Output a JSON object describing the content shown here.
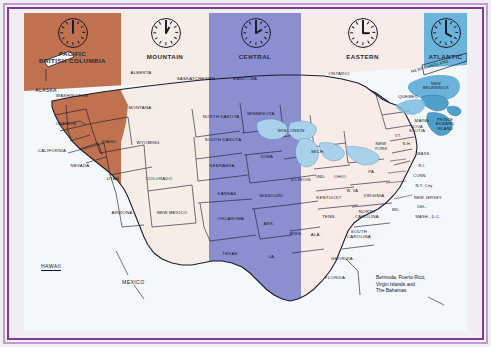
{
  "map": {
    "title": "North America Time Zone Map",
    "frame_color": "#7a3f8c",
    "background": "#f4f8fb",
    "zones": [
      {
        "id": "pacific",
        "label": "PACIFIC\nBRITISH COLUMBIA",
        "label_line1": "PACIFIC",
        "label_line2": "BRITISH COLUMBIA",
        "color": "#c0714f",
        "clock_hour": 12,
        "clock_minute": 0,
        "time": "12:00"
      },
      {
        "id": "mountain",
        "label": "MOUNTAIN",
        "label_line1": "MOUNTAIN",
        "label_line2": "",
        "color": "#f6eee6",
        "clock_hour": 1,
        "clock_minute": 0,
        "time": "1:00"
      },
      {
        "id": "central",
        "label": "CENTRAL",
        "label_line1": "CENTRAL",
        "label_line2": "",
        "color": "#8b8fd0",
        "clock_hour": 2,
        "clock_minute": 0,
        "time": "2:00"
      },
      {
        "id": "eastern",
        "label": "EASTERN",
        "label_line1": "EASTERN",
        "label_line2": "",
        "color": "#f9ece8",
        "clock_hour": 3,
        "clock_minute": 0,
        "time": "3:00"
      },
      {
        "id": "atlantic",
        "label": "ATLANTIC",
        "label_line1": "ATLANTIC",
        "label_line2": "",
        "color": "#6bb3da",
        "clock_hour": 4,
        "clock_minute": 0,
        "time": "4:00"
      }
    ],
    "regions": [
      {
        "name": "ALASKA",
        "zone": "pacific"
      },
      {
        "name": "WASHINGTON",
        "zone": "pacific"
      },
      {
        "name": "OREGON",
        "zone": "pacific"
      },
      {
        "name": "CALIFORNIA",
        "zone": "pacific"
      },
      {
        "name": "NEVADA",
        "zone": "pacific"
      },
      {
        "name": "ALBERTA",
        "zone": "mountain"
      },
      {
        "name": "MONTANA",
        "zone": "mountain"
      },
      {
        "name": "IDAHO",
        "zone": "mountain"
      },
      {
        "name": "WYOMING",
        "zone": "mountain"
      },
      {
        "name": "UTAH",
        "zone": "mountain"
      },
      {
        "name": "COLORADO",
        "zone": "mountain"
      },
      {
        "name": "ARIZONA",
        "zone": "mountain"
      },
      {
        "name": "NEW MEXICO",
        "zone": "mountain"
      },
      {
        "name": "SASKATCHEWAN",
        "zone": "mountain"
      },
      {
        "name": "MANITOBA",
        "zone": "central"
      },
      {
        "name": "NORTH DAKOTA",
        "zone": "central"
      },
      {
        "name": "SOUTH DAKOTA",
        "zone": "central"
      },
      {
        "name": "NEBRASKA",
        "zone": "central"
      },
      {
        "name": "KANSAS",
        "zone": "central"
      },
      {
        "name": "OKLAHOMA",
        "zone": "central"
      },
      {
        "name": "TEXAS",
        "zone": "central"
      },
      {
        "name": "MINNESOTA",
        "zone": "central"
      },
      {
        "name": "IOWA",
        "zone": "central"
      },
      {
        "name": "MISSOURI",
        "zone": "central"
      },
      {
        "name": "ARK.",
        "zone": "central"
      },
      {
        "name": "LA.",
        "zone": "central"
      },
      {
        "name": "WISCONSIN",
        "zone": "central"
      },
      {
        "name": "ILLINOIS",
        "zone": "central"
      },
      {
        "name": "MISS.",
        "zone": "central"
      },
      {
        "name": "ALA.",
        "zone": "central"
      },
      {
        "name": "ONTARIO",
        "zone": "eastern"
      },
      {
        "name": "QUEBEC",
        "zone": "eastern"
      },
      {
        "name": "MICH.",
        "zone": "eastern"
      },
      {
        "name": "IND.",
        "zone": "eastern"
      },
      {
        "name": "OHIO",
        "zone": "eastern"
      },
      {
        "name": "KENTUCKY",
        "zone": "eastern"
      },
      {
        "name": "TENN.",
        "zone": "eastern"
      },
      {
        "name": "W. VA.",
        "zone": "eastern"
      },
      {
        "name": "VIRGINIA",
        "zone": "eastern"
      },
      {
        "name": "NORTH CAROLINA",
        "zone": "eastern"
      },
      {
        "name": "SOUTH CAROLINA",
        "zone": "eastern"
      },
      {
        "name": "GEORGIA",
        "zone": "eastern"
      },
      {
        "name": "FLORIDA",
        "zone": "eastern"
      },
      {
        "name": "PA.",
        "zone": "eastern"
      },
      {
        "name": "NEW YORK",
        "zone": "eastern"
      },
      {
        "name": "VT.",
        "zone": "eastern"
      },
      {
        "name": "N.H.",
        "zone": "eastern"
      },
      {
        "name": "MAINE",
        "zone": "eastern"
      },
      {
        "name": "MASS.",
        "zone": "eastern"
      },
      {
        "name": "R.I.",
        "zone": "eastern"
      },
      {
        "name": "CONN.",
        "zone": "eastern"
      },
      {
        "name": "N.Y. City",
        "zone": "eastern"
      },
      {
        "name": "NEW JERSEY",
        "zone": "eastern"
      },
      {
        "name": "DEL.",
        "zone": "eastern"
      },
      {
        "name": "MD.",
        "zone": "eastern"
      },
      {
        "name": "WASH., D.C.",
        "zone": "eastern"
      },
      {
        "name": "NEWFOUNDLAND",
        "zone": "atlantic"
      },
      {
        "name": "NEW BRUNSWICK",
        "zone": "atlantic"
      },
      {
        "name": "PRINCE EDWARD ISLAND",
        "zone": "atlantic"
      },
      {
        "name": "NOVA SCOTIA",
        "zone": "atlantic"
      }
    ],
    "labels": {
      "alaska": "ALASKA",
      "washington": "WASHINGTON",
      "oregon": "OREGON",
      "california": "CALIFORNIA",
      "nevada": "NEVADA",
      "british_columbia": "BRITISH COLUMBIA",
      "alberta": "ALBERTA",
      "saskatchewan": "SASKATCHEWAN",
      "manitoba": "MANITOBA",
      "ontario": "ONTARIO",
      "quebec": "QUEBEC",
      "montana": "MONTANA",
      "idaho": "IDAHO",
      "wyoming": "WYOMING",
      "utah": "UTAH",
      "colorado": "COLORADO",
      "arizona": "ARIZONA",
      "new_mexico": "NEW MEXICO",
      "north_dakota": "NORTH DAKOTA",
      "south_dakota": "SOUTH DAKOTA",
      "nebraska": "NEBRASKA",
      "kansas": "KANSAS",
      "oklahoma": "OKLAHOMA",
      "texas": "TEXAS",
      "minnesota": "MINNESOTA",
      "iowa": "IOWA",
      "missouri": "MISSOURI",
      "arkansas": "ARK.",
      "louisiana": "LA.",
      "wisconsin": "WISCONSIN",
      "illinois": "ILLINOIS",
      "mississippi": "MISS.",
      "alabama": "ALA.",
      "michigan": "MICH.",
      "indiana": "IND.",
      "ohio": "OHIO",
      "kentucky": "KENTUCKY",
      "tennessee": "TENN.",
      "west_virginia": "W. VA.",
      "virginia": "VIRGINIA",
      "north_carolina_l1": "NORTH",
      "north_carolina_l2": "CAROLINA",
      "south_carolina_l1": "SOUTH",
      "south_carolina_l2": "CAROLINA",
      "georgia": "GEORGIA",
      "florida": "FLORIDA",
      "pennsylvania": "PA.",
      "new_york_l1": "NEW",
      "new_york_l2": "YORK",
      "vermont": "VT.",
      "new_hampshire": "N.H.",
      "maine": "MAINE",
      "massachusetts": "MASS.",
      "rhode_island": "R.I.",
      "connecticut": "CONN.",
      "nyc": "N.Y. City",
      "new_jersey": "NEW JERSEY",
      "delaware": "DEL.",
      "maryland": "MD.",
      "washington_dc": "WASH., D.C.",
      "newfoundland": "NEWFOUNDLAND",
      "new_brunswick_l1": "NEW",
      "new_brunswick_l2": "BRUNSWICK",
      "pei_l1": "PRINCE",
      "pei_l2": "EDWARD",
      "pei_l3": "ISLAND",
      "nova_scotia_l1": "NOVA",
      "nova_scotia_l2": "SCOTIA",
      "hawaii": "HAWAII",
      "mexico": "MEXICO"
    },
    "annotation": "Bermuda, Puerto Rico,\nVirgin Islands and\nThe Bahamas"
  }
}
